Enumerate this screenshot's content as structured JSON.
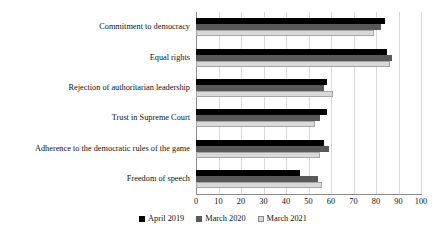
{
  "chart_data": {
    "type": "bar",
    "orientation": "horizontal",
    "title": "",
    "subtitle": "",
    "xlabel": "",
    "ylabel": "",
    "xlim": [
      0,
      100
    ],
    "xticks": [
      0,
      10,
      20,
      30,
      40,
      50,
      60,
      70,
      80,
      90,
      100
    ],
    "grid": true,
    "legend_position": "bottom",
    "categories": [
      "Commitment to democracy",
      "Equal rights",
      "Rejection of authoritarian leadership",
      "Trust in Supreme Court",
      "Adherence to the democratic rules of the game",
      "Freedom of speech"
    ],
    "series": [
      {
        "name": "April 2019",
        "color": "#000000",
        "values": [
          84,
          85,
          58,
          58,
          57,
          46
        ]
      },
      {
        "name": "March 2020",
        "color": "#595959",
        "values": [
          82,
          87,
          57,
          55,
          59,
          54
        ]
      },
      {
        "name": "March 2021",
        "color": "#d9d9d9",
        "values": [
          79,
          86,
          61,
          53,
          55,
          56
        ]
      }
    ]
  },
  "legend": {
    "entries": [
      {
        "label": "April 2019",
        "swatch": "black-square-icon"
      },
      {
        "label": "March 2020",
        "swatch": "dark-gray-square-icon"
      },
      {
        "label": "March 2021",
        "swatch": "light-gray-square-icon"
      }
    ]
  }
}
